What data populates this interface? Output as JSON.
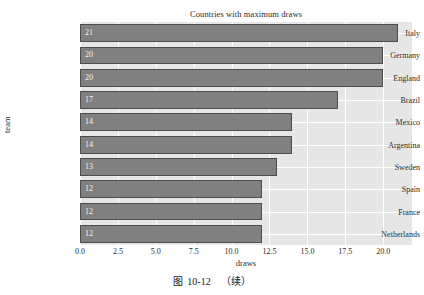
{
  "figure": {
    "caption_label": "图",
    "caption_number": "10-12",
    "caption_suffix": "（续）"
  },
  "chart_data": {
    "type": "bar",
    "orientation": "horizontal",
    "title": "Countries with maximum draws",
    "xlabel": "draws",
    "ylabel": "team",
    "categories": [
      "Italy",
      "Germany",
      "England",
      "Brazil",
      "Mexico",
      "Argentina",
      "Sweden",
      "Spain",
      "France",
      "Netherlands"
    ],
    "values": [
      21,
      20,
      20,
      17,
      14,
      14,
      13,
      12,
      12,
      12
    ],
    "value_labels": [
      "21",
      "20",
      "20",
      "17",
      "14",
      "14",
      "13",
      "12",
      "12",
      "12"
    ],
    "xlim": [
      0,
      21.9
    ],
    "xticks": [
      0,
      2.5,
      5,
      7.5,
      10,
      12.5,
      15,
      17.5,
      20
    ],
    "xtick_labels": [
      "0.0",
      "2.5",
      "5.0",
      "7.5",
      "10.0",
      "12.5",
      "15.0",
      "17.5",
      "20.0"
    ],
    "grid": true,
    "legend": null,
    "style": "darkgrid",
    "colors": {
      "bar_fill": "#808080",
      "bar_edge": "#4d4d4d",
      "plot_background": "#e6e6e6",
      "gridline": "#ffffff",
      "value_label": "#f2f2f2",
      "text": "#2b2b2b",
      "figure_background": "#ffffff"
    }
  }
}
